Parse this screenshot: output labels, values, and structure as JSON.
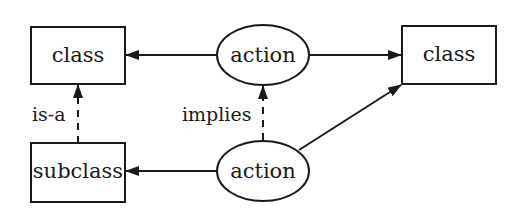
{
  "diagram": {
    "nodes": [
      {
        "id": "class_left",
        "shape": "rectangle",
        "label": "class"
      },
      {
        "id": "action_top",
        "shape": "ellipse",
        "label": "action"
      },
      {
        "id": "class_right",
        "shape": "rectangle",
        "label": "class"
      },
      {
        "id": "subclass",
        "shape": "rectangle",
        "label": "subclass"
      },
      {
        "id": "action_bottom",
        "shape": "ellipse",
        "label": "action"
      }
    ],
    "edges": [
      {
        "from": "action_top",
        "to": "class_left",
        "style": "solid",
        "label": ""
      },
      {
        "from": "action_top",
        "to": "class_right",
        "style": "solid",
        "label": ""
      },
      {
        "from": "subclass",
        "to": "class_left",
        "style": "dashed",
        "label": "is-a"
      },
      {
        "from": "action_bottom",
        "to": "action_top",
        "style": "dashed",
        "label": "implies"
      },
      {
        "from": "action_bottom",
        "to": "subclass",
        "style": "solid",
        "label": ""
      },
      {
        "from": "action_bottom",
        "to": "class_right",
        "style": "solid",
        "label": ""
      }
    ],
    "colors": {
      "stroke": "#1a1a1a",
      "background": "#ffffff"
    }
  }
}
